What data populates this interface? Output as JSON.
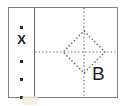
{
  "figure": {
    "background_color": "#ffffff",
    "frame": {
      "border_color": "#808080",
      "divider_color": "#6a6a6a"
    },
    "left_panel": {
      "name": "marker-column",
      "markers": [
        {
          "type": "dot",
          "glyph": "",
          "y_percent": 15
        },
        {
          "type": "cross",
          "glyph": "X",
          "y_percent": 33
        },
        {
          "type": "dot",
          "glyph": "",
          "y_percent": 52
        },
        {
          "type": "dot",
          "glyph": "",
          "y_percent": 72
        },
        {
          "type": "dot",
          "glyph": "",
          "y_percent": 92
        }
      ]
    },
    "right_panel": {
      "name": "diamond-panel",
      "label": "B",
      "shapes": {
        "diamond": {
          "stroke_color": "#555555",
          "stroke_style": "dotted",
          "center_x": 49,
          "center_y": 44,
          "half_width": 21,
          "half_height": 21
        },
        "crosshair": {
          "stroke_color": "#6b6b6b",
          "stroke_style": "dotted",
          "vertical_x": 49,
          "horizontal_y": 44
        }
      }
    }
  }
}
